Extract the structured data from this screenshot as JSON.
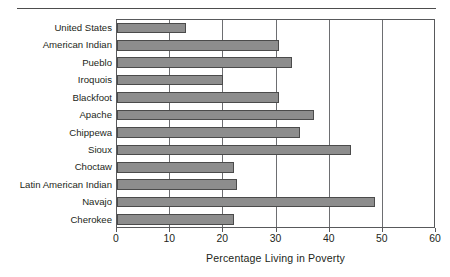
{
  "chart_data": {
    "type": "bar",
    "orientation": "horizontal",
    "title": "",
    "xlabel": "Percentage Living in Poverty",
    "ylabel": "",
    "xlim": [
      0,
      60
    ],
    "xticks": [
      "0",
      "10",
      "20",
      "30",
      "40",
      "50",
      "60"
    ],
    "grid": true,
    "legend": false,
    "bar_color": "#8d8d8d",
    "bar_edge_color": "#4b4b4b",
    "categories": [
      "United States",
      "American Indian",
      "Pueblo",
      "Iroquois",
      "Blackfoot",
      "Apache",
      "Chippewa",
      "Sioux",
      "Choctaw",
      "Latin American Indian",
      "Navajo",
      "Cherokee"
    ],
    "values": [
      13,
      30.5,
      33,
      20,
      30.5,
      37,
      34.5,
      44,
      22,
      22.5,
      48.5,
      22
    ]
  },
  "axis": {
    "title": "Percentage Living in Poverty"
  }
}
